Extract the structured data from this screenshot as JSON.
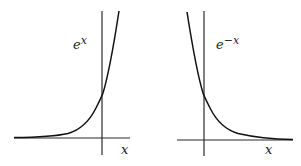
{
  "panels": [
    {
      "id": "exp-growth",
      "curve_label_base": "e",
      "curve_label_exp": "x",
      "x_axis_label": "x",
      "function": "e^x"
    },
    {
      "id": "exp-decay",
      "curve_label_base": "e",
      "curve_label_exp": "−x",
      "x_axis_label": "x",
      "function": "e^-x"
    }
  ],
  "colors": {
    "axis": "#2a2a2a",
    "curve": "#111111",
    "background": "#ffffff"
  }
}
